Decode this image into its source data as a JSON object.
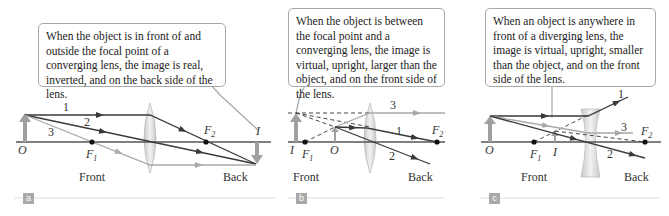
{
  "figure": {
    "panels": [
      {
        "id": "a",
        "caption": "When the object is in front of and outside the focal point of a converging lens, the image is real, inverted, and on the back side of the lens.",
        "lens_type": "converging",
        "labels": {
          "object": "O",
          "image": "I",
          "f1": "F",
          "f1_sub": "1",
          "f2": "F",
          "f2_sub": "2",
          "front": "Front",
          "back": "Back",
          "ray1": "1",
          "ray2": "2",
          "ray3": "3"
        },
        "badge": "a"
      },
      {
        "id": "b",
        "caption": "When the object is between the focal point and a converging lens, the image is virtual, upright, larger than the object, and on the front side of the lens.",
        "lens_type": "converging",
        "labels": {
          "object": "O",
          "image": "I",
          "f1": "F",
          "f1_sub": "1",
          "f2": "F",
          "f2_sub": "2",
          "front": "Front",
          "back": "Back",
          "ray1": "1",
          "ray2": "2",
          "ray3": "3"
        },
        "badge": "b"
      },
      {
        "id": "c",
        "caption": "When an object is anywhere in front of a diverging lens, the image is virtual, upright, smaller than the object, and on the front side of the lens.",
        "lens_type": "diverging",
        "labels": {
          "object": "O",
          "image": "I",
          "f1": "F",
          "f1_sub": "1",
          "f2": "F",
          "f2_sub": "2",
          "front": "Front",
          "back": "Back",
          "ray1": "1",
          "ray2": "2",
          "ray3": "3"
        },
        "badge": "c"
      }
    ],
    "colors": {
      "axis": "#555555",
      "ray_dark": "#3a3a3a",
      "ray_light": "#a9a9a9",
      "arrow_gray": "#a0a0a0",
      "lens_fill": "#dcdcdc",
      "callout_border": "#a8a8a8"
    }
  }
}
